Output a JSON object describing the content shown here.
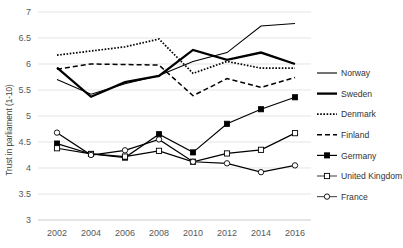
{
  "chart_data": {
    "type": "line",
    "title": "",
    "xlabel": "",
    "ylabel": "Trust in parliament (1-10)",
    "x": [
      2002,
      2004,
      2006,
      2008,
      2010,
      2012,
      2014,
      2016
    ],
    "xtick_labels": [
      "2002",
      "2004",
      "2006",
      "2008",
      "2010",
      "2012",
      "2014",
      "2016"
    ],
    "ytick_labels": [
      "3",
      "3.5",
      "4",
      "4.5",
      "5",
      "5.5",
      "6",
      "6.5",
      "7"
    ],
    "yticks": [
      3,
      3.5,
      4,
      4.5,
      5,
      5.5,
      6,
      6.5,
      7
    ],
    "ylim": [
      3,
      7
    ],
    "grid": "horizontal",
    "legend_position": "right",
    "series": [
      {
        "name": "Norway",
        "style": "thin-solid",
        "marker": "none",
        "color": "#000000",
        "values": [
          5.7,
          5.42,
          5.62,
          5.78,
          6.05,
          6.22,
          6.73,
          6.78
        ]
      },
      {
        "name": "Sweden",
        "style": "thick-solid",
        "marker": "none",
        "color": "#000000",
        "values": [
          5.93,
          5.37,
          5.65,
          5.77,
          6.27,
          6.08,
          6.22,
          6.0
        ]
      },
      {
        "name": "Denmark",
        "style": "dotted",
        "marker": "none",
        "color": "#000000",
        "values": [
          6.17,
          6.25,
          6.33,
          6.48,
          5.82,
          6.05,
          5.92,
          5.92
        ]
      },
      {
        "name": "Finland",
        "style": "dashed",
        "marker": "none",
        "color": "#000000",
        "values": [
          5.9,
          6.0,
          5.99,
          5.98,
          5.39,
          5.72,
          5.55,
          5.74
        ]
      },
      {
        "name": "Germany",
        "style": "solid-marker",
        "marker": "filled-square",
        "color": "#000000",
        "values": [
          4.47,
          4.27,
          4.2,
          4.65,
          4.3,
          4.85,
          5.13,
          5.36
        ]
      },
      {
        "name": "United Kingdom",
        "style": "solid-marker",
        "marker": "open-square",
        "color": "#595959",
        "values": [
          4.38,
          4.27,
          4.22,
          4.33,
          4.12,
          4.28,
          4.35,
          4.67
        ]
      },
      {
        "name": "France",
        "style": "solid-marker",
        "marker": "open-circle",
        "color": "#595959",
        "values": [
          4.68,
          4.25,
          4.34,
          4.55,
          4.12,
          4.09,
          3.92,
          4.05
        ]
      }
    ]
  },
  "legend": {
    "items": [
      {
        "label": "Norway"
      },
      {
        "label": "Sweden"
      },
      {
        "label": "Denmark"
      },
      {
        "label": "Finland"
      },
      {
        "label": "Germany"
      },
      {
        "label": "United Kingdom"
      },
      {
        "label": "France"
      }
    ]
  },
  "axis": {
    "y_title": "Trust in parliament (1-10)"
  }
}
